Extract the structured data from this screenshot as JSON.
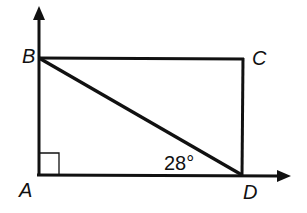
{
  "diagram": {
    "points": {
      "A": {
        "label": "A",
        "x": 39,
        "y": 175
      },
      "B": {
        "label": "B",
        "x": 39,
        "y": 58
      },
      "C": {
        "label": "C",
        "x": 243,
        "y": 59
      },
      "D": {
        "label": "D",
        "x": 242,
        "y": 175
      }
    },
    "angle_label": "28°",
    "right_angle_at": "A",
    "colors": {
      "stroke": "#111111",
      "background": "#ffffff"
    }
  }
}
